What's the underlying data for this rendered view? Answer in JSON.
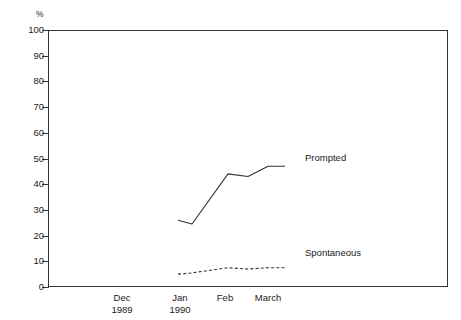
{
  "chart_data": {
    "type": "line",
    "title": "",
    "subtitle": "",
    "xlabel": "",
    "ylabel": "%",
    "ylim": [
      0,
      100
    ],
    "ytick_step": 10,
    "grid": false,
    "legend_position": "inline-right",
    "yticks": [
      "100",
      "90",
      "80",
      "70",
      "60",
      "50",
      "40",
      "30",
      "20",
      "10",
      "0"
    ],
    "ytick_values": [
      100,
      90,
      80,
      70,
      60,
      50,
      40,
      30,
      20,
      10,
      0
    ],
    "categories": [
      "Dec 1989",
      "Jan 1990",
      "Feb",
      "March"
    ],
    "xtick_labels": [
      {
        "line1": "Dec",
        "line2": "1989"
      },
      {
        "line1": "Jan",
        "line2": "1990"
      },
      {
        "line1": "Feb",
        "line2": ""
      },
      {
        "line1": "March",
        "line2": ""
      }
    ],
    "series": [
      {
        "name": "Prompted",
        "style": "solid",
        "color": "#333333",
        "x": [
          "Jan 1990",
          "mid-Jan",
          "Feb",
          "mid-Feb",
          "March",
          "late-March"
        ],
        "values": [
          26,
          24.5,
          44,
          43,
          47,
          47
        ]
      },
      {
        "name": "Spontaneous",
        "style": "dotted",
        "color": "#333333",
        "x": [
          "Jan 1990",
          "mid-Jan",
          "Feb",
          "mid-Feb",
          "March",
          "late-March"
        ],
        "values": [
          5,
          5.5,
          7.5,
          7,
          7.5,
          7.5
        ]
      }
    ],
    "annotations": [
      {
        "text": "Prompted",
        "series": "Prompted"
      },
      {
        "text": "Spontaneous",
        "series": "Spontaneous"
      }
    ]
  },
  "axis_unit": "%"
}
